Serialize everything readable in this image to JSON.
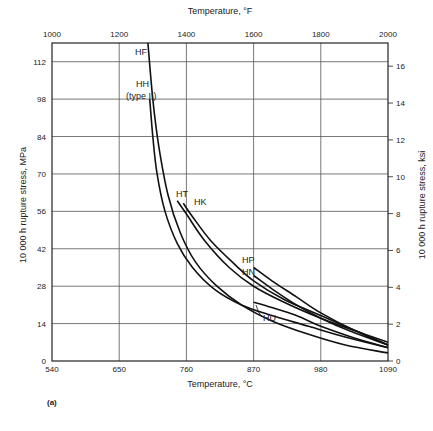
{
  "caption": "(a)",
  "chart_data": {
    "type": "line",
    "title": "",
    "xlabel": "Temperature, °C",
    "xlabel_top": "Temperature, °F",
    "ylabel": "10 000 h rupture stress, MPa",
    "ylabel_right": "10 000 h rupture stress, ksi",
    "xlim": [
      540,
      1090
    ],
    "ylim": [
      0,
      119
    ],
    "x_ticks": [
      540,
      650,
      760,
      870,
      980,
      1090
    ],
    "x_ticks_top": [
      1000,
      1200,
      1400,
      1600,
      1800,
      2000
    ],
    "y_ticks": [
      0,
      14,
      28,
      42,
      56,
      70,
      84,
      98,
      112
    ],
    "y_ticks_right": [
      0,
      2,
      4,
      6,
      8,
      10,
      12,
      14,
      16
    ],
    "grid": true,
    "legend": "inline curve labels",
    "series": [
      {
        "name": "HF",
        "x": [
          697,
          705,
          715,
          730,
          750,
          775,
          810,
          850,
          900,
          960,
          1020,
          1090
        ],
        "y": [
          119,
          98,
          80,
          62,
          48,
          37,
          28,
          21,
          15,
          10,
          6,
          3
        ]
      },
      {
        "name": "HH (type II)",
        "x": [
          700,
          705,
          712,
          725,
          745,
          770,
          805,
          850,
          900,
          960,
          1020,
          1090
        ],
        "y": [
          98,
          84,
          70,
          56,
          44,
          35,
          27,
          21,
          17,
          13,
          9,
          5
        ]
      },
      {
        "name": "HT",
        "x": [
          745,
          760,
          790,
          830,
          870,
          920,
          980,
          1040,
          1090
        ],
        "y": [
          60,
          55,
          45,
          35,
          28,
          22,
          16,
          11,
          7
        ]
      },
      {
        "name": "HK",
        "x": [
          755,
          770,
          800,
          840,
          870,
          920,
          980,
          1040,
          1090
        ],
        "y": [
          59,
          54,
          45,
          36,
          30,
          23,
          17,
          11,
          6
        ]
      },
      {
        "name": "HP",
        "x": [
          870,
          900,
          940,
          980,
          1030,
          1090
        ],
        "y": [
          35,
          30,
          24,
          18,
          12,
          6
        ]
      },
      {
        "name": "HN",
        "x": [
          870,
          900,
          940,
          980,
          1030,
          1090
        ],
        "y": [
          32,
          27,
          21,
          16,
          11,
          6
        ]
      },
      {
        "name": "HU",
        "x": [
          870,
          900,
          940,
          980,
          1030,
          1090
        ],
        "y": [
          22,
          20,
          17,
          13,
          9,
          5
        ]
      }
    ]
  },
  "labels": {
    "HF": "HF",
    "HH": "HH",
    "HH_sub": "(type II)",
    "HT": "HT",
    "HK": "HK",
    "HP": "HP",
    "HN": "HN",
    "HU": "HU"
  }
}
